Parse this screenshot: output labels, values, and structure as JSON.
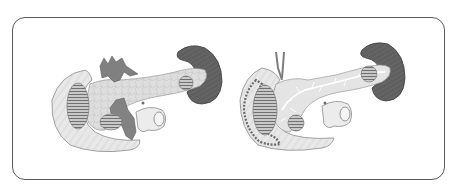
{
  "figure": {
    "panels": [
      {
        "id": "left",
        "label": "Pancreas with surrounding vessels and spleen (external view)"
      },
      {
        "id": "right",
        "label": "Pancreas with ductal system and duodenal folds (sectional view)"
      }
    ]
  },
  "colors": {
    "frame": "#5a5a5a",
    "tissue_light": "#e6e6e6",
    "tissue_outline": "#8c8c8c",
    "pancreas": "#dcdcdc",
    "spleen": "#5e5e5e",
    "vessel": "#7d7d7d",
    "hatch": "#7a7a7a",
    "duct": "#ffffff"
  }
}
